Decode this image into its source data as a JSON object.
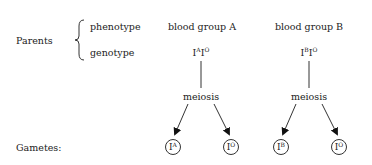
{
  "labels": {
    "parents": "Parents",
    "phenotype": "phenotype",
    "genotype": "genotype",
    "gametes": "Gametes:"
  },
  "parents": [
    {
      "phenotype": "blood group A",
      "genotype": {
        "a1": "I",
        "s1": "A",
        "a2": "I",
        "s2": "O"
      },
      "process": "meiosis",
      "gametes": [
        {
          "base": "I",
          "sup": "A"
        },
        {
          "base": "I",
          "sup": "O"
        }
      ]
    },
    {
      "phenotype": "blood group B",
      "genotype": {
        "a1": "I",
        "s1": "B",
        "a2": "I",
        "s2": "O"
      },
      "process": "meiosis",
      "gametes": [
        {
          "base": "I",
          "sup": "B"
        },
        {
          "base": "I",
          "sup": "O"
        }
      ]
    }
  ],
  "colors": {
    "line": "#333333",
    "text": "#222222",
    "background": "#ffffff"
  }
}
